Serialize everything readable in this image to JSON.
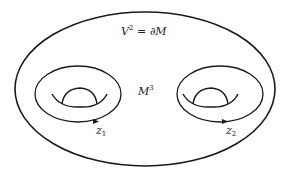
{
  "diagram": {
    "boundary_label": {
      "base": "V",
      "sup": "2",
      "rest": " = ∂M"
    },
    "interior_label": {
      "base": "M",
      "sup": "3"
    },
    "tori": [
      {
        "label_base": "z",
        "label_sub": "1"
      },
      {
        "label_base": "z",
        "label_sub": "2"
      }
    ],
    "colors": {
      "stroke": "#1a1a1a",
      "background": "#ffffff"
    }
  }
}
